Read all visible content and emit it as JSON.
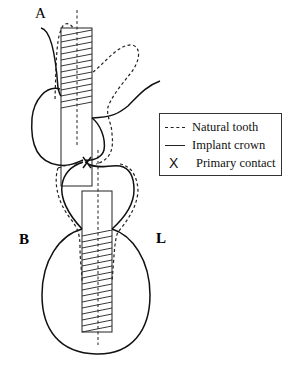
{
  "figure": {
    "labels": {
      "a": "A",
      "b": "B",
      "l": "L"
    },
    "legend": {
      "items": [
        {
          "symbol": "dashed-line",
          "label": "Natural tooth"
        },
        {
          "symbol": "solid-line",
          "label": "Implant crown"
        },
        {
          "symbol": "X",
          "label": "Primary contact"
        }
      ]
    },
    "colors": {
      "stroke": "#111111",
      "background": "#ffffff"
    }
  }
}
